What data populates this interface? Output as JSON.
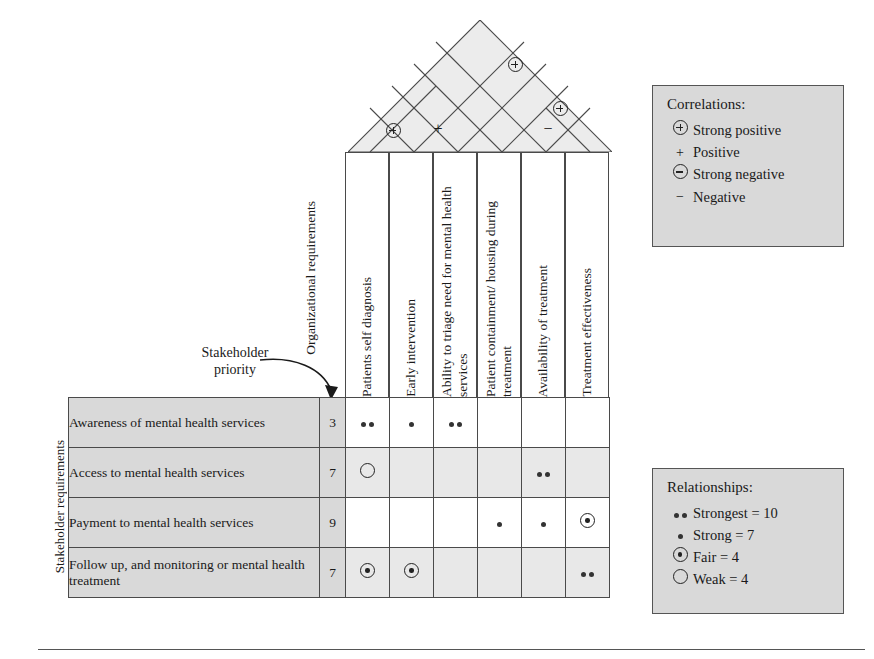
{
  "labels": {
    "organizational_requirements": "Organizational\nrequirements",
    "organizational_requirements_line1": "Organizational",
    "organizational_requirements_line2": "requirements",
    "stakeholder_priority_line1": "Stakeholder",
    "stakeholder_priority_line2": "priority",
    "stakeholder_requirements": "Stakeholder requirements"
  },
  "columns": [
    {
      "id": "c1",
      "label": "Patients self diagnosis"
    },
    {
      "id": "c2",
      "label": "Early intervention"
    },
    {
      "id": "c3",
      "label": "Ability to triage need for\nmental health services"
    },
    {
      "id": "c4",
      "label": "Patient containment/\nhousing during treatment"
    },
    {
      "id": "c5",
      "label": "Availability of treatment"
    },
    {
      "id": "c6",
      "label": "Treatment effectiveness"
    }
  ],
  "rows": [
    {
      "label": "Awareness of mental health services",
      "priority": "3",
      "cells": [
        "strongest",
        "strong",
        "strongest",
        "",
        "",
        ""
      ]
    },
    {
      "label": "Access to mental health services",
      "priority": "7",
      "cells": [
        "weak",
        "",
        "",
        "",
        "strongest",
        ""
      ]
    },
    {
      "label": "Payment to mental health services",
      "priority": "9",
      "cells": [
        "",
        "",
        "",
        "strong",
        "strong",
        "fair"
      ]
    },
    {
      "label": "Follow up, and monitoring or mental health treatment",
      "priority": "7",
      "cells": [
        "fair",
        "fair",
        "",
        "",
        "",
        "strongest"
      ]
    }
  ],
  "roof_correlations": [
    {
      "col_a": 1,
      "col_b": 2,
      "type": "strong-positive",
      "symbol": "circle-plus"
    },
    {
      "col_a": 2,
      "col_b": 3,
      "type": "positive",
      "symbol": "plus"
    },
    {
      "col_a": 5,
      "col_b": 6,
      "type": "negative",
      "symbol": "minus"
    },
    {
      "col_a": 4,
      "col_b": 6,
      "type": "strong-positive",
      "symbol": "circle-plus"
    },
    {
      "col_a": 3,
      "col_b": 6,
      "type": "strong-positive",
      "symbol": "circle-plus"
    }
  ],
  "legend_correlations": {
    "title": "Correlations:",
    "items": [
      {
        "symbol": "circle-plus",
        "label": "Strong positive"
      },
      {
        "symbol": "plus",
        "label": "Positive"
      },
      {
        "symbol": "circle-minus",
        "label": "Strong negative"
      },
      {
        "symbol": "minus",
        "label": "Negative"
      }
    ]
  },
  "legend_relationships": {
    "title": "Relationships:",
    "items": [
      {
        "symbol": "double-dot",
        "label": "Strongest = 10"
      },
      {
        "symbol": "dot",
        "label": "Strong = 7"
      },
      {
        "symbol": "ring-dot",
        "label": "Fair = 4"
      },
      {
        "symbol": "ring",
        "label": "Weak = 4"
      }
    ]
  },
  "colors": {
    "header_fill": "#e8e8e8",
    "row_label_fill": "#d9d9d9",
    "roof_fill": "#ececec",
    "legend_fill": "#d9d9d9",
    "line": "#4a4a4a"
  }
}
